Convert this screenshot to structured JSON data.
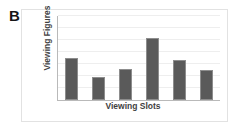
{
  "panel": {
    "letter": "B"
  },
  "colors": {
    "bar_fill": "#5a5a5a",
    "bar_edge": "#8d8d8d",
    "gridline": "#eeeeee",
    "axis_line": "#b9b9b9",
    "frame_border": "#e2e2e2",
    "axis_text": "#3f3f3f",
    "panel_letter": "#161616",
    "background": "#ffffff"
  },
  "chart_data": {
    "type": "bar",
    "title": "",
    "subtitle": "",
    "panel_label": "B",
    "xlabel": "Viewing Slots",
    "ylabel": "Viewing Figures",
    "categories": [
      "1",
      "2",
      "3",
      "4",
      "5",
      "6"
    ],
    "values": [
      3.5,
      1.9,
      2.6,
      5.2,
      3.3,
      2.5
    ],
    "series": [
      {
        "name": "Viewing Figures",
        "values": [
          3.5,
          1.9,
          2.6,
          5.2,
          3.3,
          2.5
        ]
      }
    ],
    "ylim": [
      0,
      7
    ],
    "xlim": [
      0,
      6
    ],
    "xtick_labels": [],
    "ytick_labels": [],
    "gridlines": {
      "horizontal": true,
      "vertical": false,
      "count": 7,
      "values": [
        1,
        2,
        3,
        4,
        5,
        6,
        7
      ]
    },
    "legend": {
      "visible": false,
      "position": "none",
      "entries": []
    },
    "annotations": [],
    "bar_color": "#5a5a5a",
    "bar_width_ratio": 0.46
  }
}
